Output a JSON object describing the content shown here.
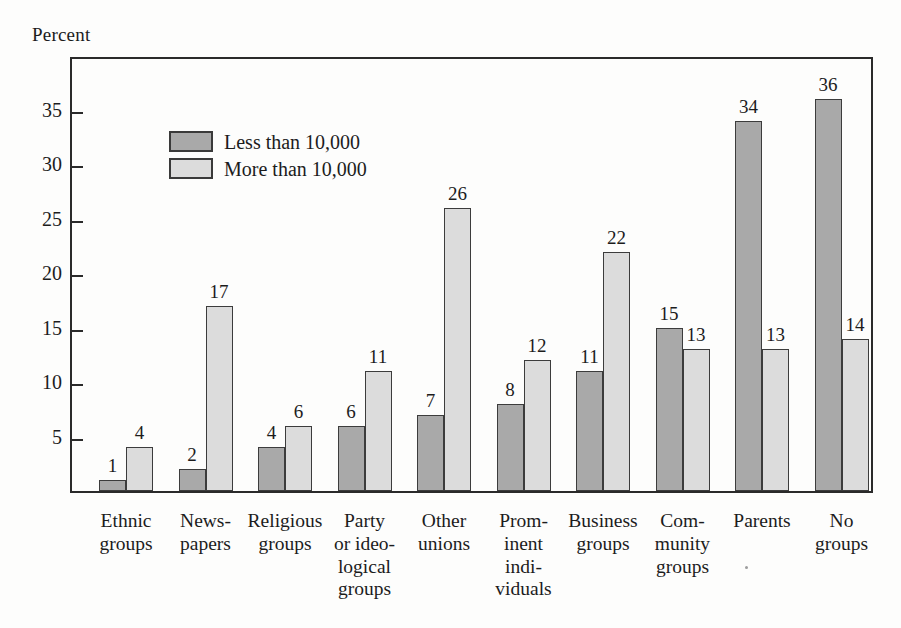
{
  "axis_title": "Percent",
  "legend": {
    "items": [
      {
        "label": "Less than 10,000",
        "color": "#a9a9a9"
      },
      {
        "label": "More than 10,000",
        "color": "#dcdcdc"
      }
    ]
  },
  "y_axis": {
    "ticks": [
      "35",
      "30",
      "25",
      "20",
      "15",
      "10",
      "5"
    ]
  },
  "categories": [
    {
      "lines": [
        "Ethnic",
        "groups"
      ]
    },
    {
      "lines": [
        "News-",
        "papers"
      ]
    },
    {
      "lines": [
        "Religious",
        "groups"
      ]
    },
    {
      "lines": [
        "Party",
        "or ideo-",
        "logical",
        "groups"
      ]
    },
    {
      "lines": [
        "Other",
        "unions"
      ]
    },
    {
      "lines": [
        "Prom-",
        "inent",
        "indi-",
        "viduals"
      ]
    },
    {
      "lines": [
        "Business",
        "groups"
      ]
    },
    {
      "lines": [
        "Com-",
        "munity",
        "groups"
      ]
    },
    {
      "lines": [
        "Parents"
      ]
    },
    {
      "lines": [
        "No",
        "groups"
      ]
    }
  ],
  "chart_data": {
    "type": "bar",
    "title": "",
    "xlabel": "",
    "ylabel": "Percent",
    "ylim": [
      0,
      38
    ],
    "yticks": [
      5,
      10,
      15,
      20,
      25,
      30,
      35
    ],
    "grid": false,
    "legend_position": "top-left-inside",
    "categories": [
      "Ethnic groups",
      "Newspapers",
      "Religious groups",
      "Party or ideological groups",
      "Other unions",
      "Prominent individuals",
      "Business groups",
      "Community groups",
      "Parents",
      "No groups"
    ],
    "series": [
      {
        "name": "Less than 10,000",
        "color": "#a9a9a9",
        "values": [
          1,
          2,
          4,
          6,
          7,
          8,
          11,
          15,
          34,
          36
        ]
      },
      {
        "name": "More than 10,000",
        "color": "#dcdcdc",
        "values": [
          4,
          17,
          6,
          11,
          26,
          12,
          22,
          13,
          13,
          14
        ]
      }
    ]
  }
}
